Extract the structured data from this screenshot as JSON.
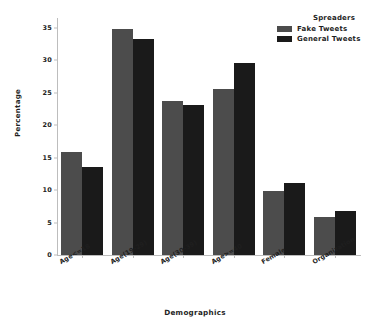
{
  "chart_data": {
    "type": "bar",
    "title": "",
    "xlabel": "Demographics",
    "ylabel": "Percentage",
    "categories": [
      "Age<=18",
      "Age(19-29)",
      "Age(30-39)",
      "Age>=40",
      "Female",
      "Organization"
    ],
    "series": [
      {
        "name": "Fake Tweets",
        "color": "#4c4c4c",
        "values": [
          15.8,
          34.8,
          23.7,
          25.5,
          9.9,
          5.9
        ]
      },
      {
        "name": "General Tweets",
        "color": "#1a1a1a",
        "values": [
          13.6,
          33.3,
          23.1,
          29.6,
          11.1,
          6.8
        ]
      }
    ],
    "ylim": [
      0,
      36.5
    ],
    "yticks": [
      0,
      5,
      10,
      15,
      20,
      25,
      30,
      35
    ],
    "ytick_labels": [
      "0",
      "5",
      "10",
      "15",
      "20",
      "25",
      "30",
      "35"
    ],
    "grid": false,
    "legend": {
      "title": "Spreaders",
      "position": "top-right",
      "entries": [
        "Fake Tweets",
        "General Tweets"
      ]
    }
  }
}
